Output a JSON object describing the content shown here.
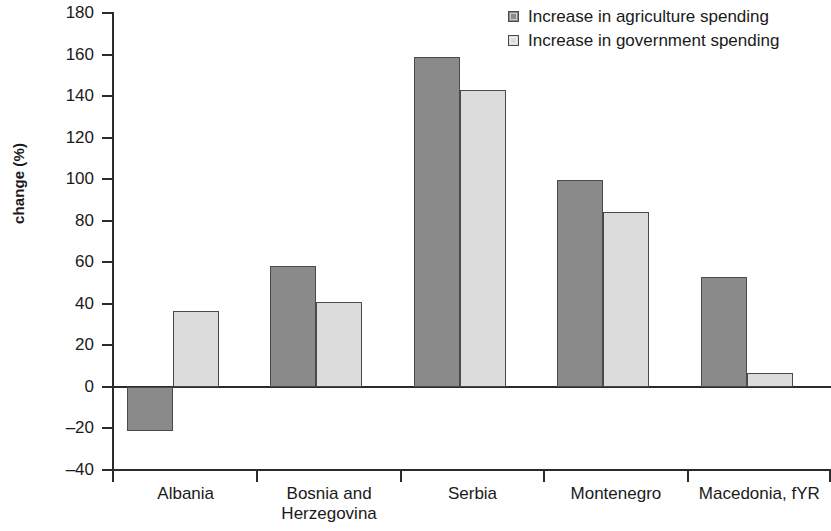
{
  "chart_data": {
    "type": "bar",
    "title": "",
    "xlabel": "",
    "ylabel": "change (%)",
    "ylim": [
      -40,
      180
    ],
    "ytick_step": 20,
    "yticks": [
      -40,
      -20,
      0,
      20,
      40,
      60,
      80,
      100,
      120,
      140,
      160,
      180
    ],
    "ytick_labels": [
      "–40",
      "–20",
      "0",
      "20",
      "40",
      "60",
      "80",
      "100",
      "120",
      "140",
      "160",
      "180"
    ],
    "grid": false,
    "zero_line": true,
    "legend_position": "top-right",
    "categories": [
      "Albania",
      "Bosnia and\nHerzegovina",
      "Serbia",
      "Montenegro",
      "Macedonia, fYR"
    ],
    "series": [
      {
        "name": "Increase in agriculture spending",
        "color": "#8a8a8a",
        "values": [
          -21,
          58,
          159,
          99.5,
          53
        ]
      },
      {
        "name": "Increase in government spending",
        "color": "#dcdcdc",
        "values": [
          36.5,
          41,
          143,
          84,
          6.5
        ]
      }
    ]
  },
  "legend": {
    "items": [
      {
        "label": "Increase in agriculture spending",
        "color": "#8a8a8a"
      },
      {
        "label": "Increase in government spending",
        "color": "#dcdcdc"
      }
    ]
  },
  "axis": {
    "y_title": "change (%)"
  },
  "colors": {
    "series_dark": "#8a8a8a",
    "series_light": "#dcdcdc",
    "axis": "#2b2b2b",
    "bar_border": "#4a4a4a",
    "background": "#ffffff",
    "text": "#1a1a1a"
  }
}
